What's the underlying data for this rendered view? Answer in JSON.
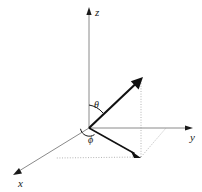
{
  "figure": {
    "background_color": "#ffffff",
    "axis_color": "#8a8a8a",
    "vector_color": "#111111",
    "dotted_color": "#b4b4b4",
    "label_color": "#1a1a1a"
  },
  "axes": [
    {
      "id": "z-axis",
      "label": "z",
      "label_x": 95,
      "label_y": 16,
      "start_x": 89,
      "start_y": 128,
      "end_x": 89,
      "end_y": 9,
      "direction": "up"
    },
    {
      "id": "y-axis",
      "label": "y",
      "label_x": 190,
      "label_y": 141,
      "start_x": 89,
      "start_y": 128,
      "end_x": 191,
      "end_y": 128,
      "direction": "right"
    },
    {
      "id": "x-axis",
      "label": "x",
      "label_x": 18,
      "label_y": 187,
      "start_x": 89,
      "start_y": 128,
      "end_x": 15,
      "end_y": 173,
      "direction": "down-left"
    }
  ],
  "vector": {
    "id": "radial-vector",
    "origin_x": 89,
    "origin_y": 128,
    "tip_x": 142,
    "tip_y": 78
  },
  "projection": {
    "id": "xy-plane-projection",
    "origin_x": 89,
    "origin_y": 128,
    "tip_x": 140,
    "tip_y": 157
  },
  "guides": [
    {
      "id": "vertical-drop-guide",
      "x1": 141,
      "y1": 78,
      "x2": 141,
      "y2": 157
    },
    {
      "id": "y-axis-projection-guide",
      "x1": 141,
      "y1": 157,
      "x2": 166,
      "y2": 128
    },
    {
      "id": "x-axis-projection-guide",
      "x1": 141,
      "y1": 157,
      "x2": 56,
      "y2": 158
    }
  ],
  "angles": [
    {
      "id": "theta",
      "symbol": "θ",
      "label_x": 94,
      "label_y": 108,
      "description": "polar angle from z-axis to radial vector"
    },
    {
      "id": "phi",
      "symbol": "ϕ",
      "label_x": 88,
      "label_y": 143,
      "description": "azimuthal angle in xy-plane from x-axis"
    }
  ]
}
